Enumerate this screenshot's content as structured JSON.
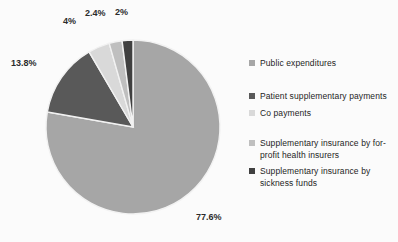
{
  "chart_data": {
    "type": "pie",
    "title": "",
    "subtitle": "",
    "xlabel": "",
    "ylabel": "",
    "grid": false,
    "legend_position": "right",
    "start_angle_deg": 0,
    "direction": "clockwise",
    "categories": [
      "Public expenditures",
      "Patient supplementary payments",
      "Co payments",
      "Supplementary insurance by for-profit health insurers",
      "Supplementary insurance by sickness funds"
    ],
    "values": [
      77.6,
      13.8,
      4,
      2.4,
      2
    ],
    "data_labels": [
      "77.6%",
      "13.8%",
      "4%",
      "2.4%",
      "2%"
    ],
    "colors": [
      "#a6a6a6",
      "#595959",
      "#d9d9d9",
      "#bfbfbf",
      "#404040"
    ],
    "slice_border_color": "#f2f2f2"
  },
  "legend": {
    "items": [
      {
        "label": "Public expenditures",
        "color": "#a6a6a6"
      },
      {
        "label": "Patient supplementary payments",
        "color": "#595959"
      },
      {
        "label": "Co payments",
        "color": "#d9d9d9"
      },
      {
        "label": "Supplementary insurance by for-profit health insurers",
        "color": "#bfbfbf"
      },
      {
        "label": "Supplementary insurance by sickness funds",
        "color": "#404040"
      }
    ]
  },
  "background_color": "#fbfbfb"
}
